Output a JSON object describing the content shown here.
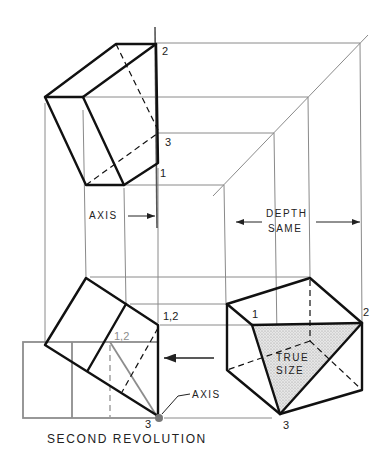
{
  "figure": {
    "caption": "SECOND REVOLUTION",
    "colors": {
      "object_lines": "#111111",
      "projection_lines": "#8a8a8a",
      "true_size_fill": "#d9d9d9",
      "revolved_gray": "#8d8d8d"
    }
  },
  "top_view": {
    "point_labels": {
      "p2": "2",
      "p3": "3",
      "p1": "1"
    },
    "axis_label": "AXIS"
  },
  "depth_note": {
    "line1": "DEPTH",
    "line2": "SAME"
  },
  "front_view": {
    "point_labels": {
      "p12": "1,2",
      "p12_gray": "1,2",
      "p3": "3"
    },
    "axis_label": "AXIS"
  },
  "side_view": {
    "point_labels": {
      "p1": "1",
      "p2": "2",
      "p3": "3"
    },
    "true_size_line1": "TRUE",
    "true_size_line2": "SIZE"
  }
}
